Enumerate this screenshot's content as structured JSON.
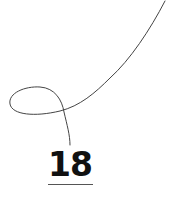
{
  "figure": {
    "number": "18",
    "stroke_color": "#444444",
    "text_color": "#111111",
    "underline_color": "#555555",
    "background": "#ffffff"
  }
}
